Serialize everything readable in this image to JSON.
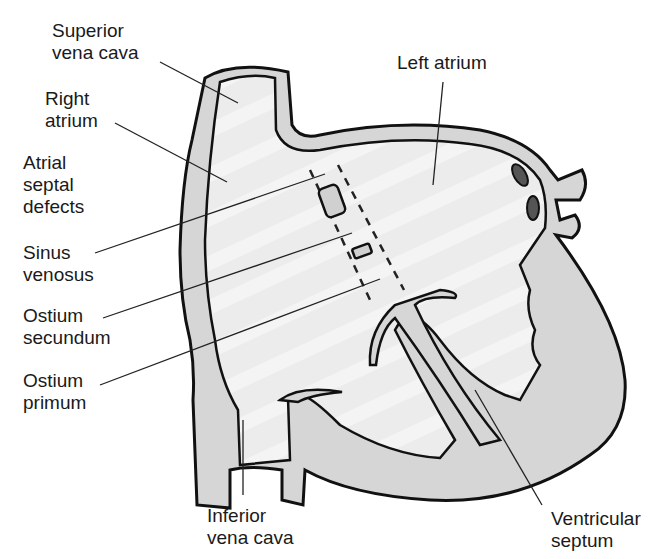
{
  "colors": {
    "background": "#ffffff",
    "wall_fill": "#d6d6d6",
    "chamber_fill": "#eeeeee",
    "outline": "#111111",
    "text": "#1a1a1a"
  },
  "labels": {
    "superior_vena_cava": {
      "line1": "Superior",
      "line2": "vena cava"
    },
    "right_atrium": {
      "line1": "Right",
      "line2": "atrium"
    },
    "atrial_septal_defects": {
      "line1": "Atrial",
      "line2": "septal",
      "line3": "defects"
    },
    "sinus_venosus": {
      "line1": "Sinus",
      "line2": "venosus"
    },
    "ostium_secundum": {
      "line1": "Ostium",
      "line2": "secundum"
    },
    "ostium_primum": {
      "line1": "Ostium",
      "line2": "primum"
    },
    "left_atrium": {
      "line1": "Left atrium"
    },
    "inferior_vena_cava": {
      "line1": "Inferior",
      "line2": "vena cava"
    },
    "ventricular_septum": {
      "line1": "Ventricular",
      "line2": "septum"
    }
  }
}
